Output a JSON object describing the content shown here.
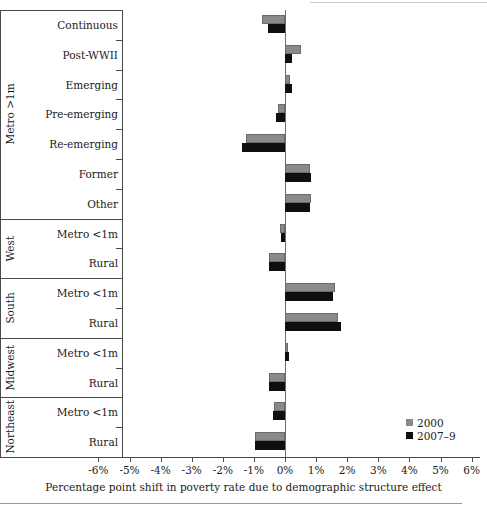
{
  "chart_data": {
    "type": "bar",
    "orientation": "horizontal",
    "title": "",
    "xlabel": "Percentage point shift in poverty rate due to demographic structure effect",
    "ylabel": "",
    "xlim": [
      -6,
      6
    ],
    "xticks": [
      "-6%",
      "-5%",
      "-4%",
      "-3%",
      "-2%",
      "-1%",
      "0%",
      "1%",
      "2%",
      "3%",
      "4%",
      "5%",
      "6%"
    ],
    "xtick_values": [
      -6,
      -5,
      -4,
      -3,
      -2,
      -1,
      0,
      1,
      2,
      3,
      4,
      5,
      6
    ],
    "grid": false,
    "legend_position": "bottom-right",
    "categories": [
      "Continuous",
      "Post-WWII",
      "Emerging",
      "Pre-emerging",
      "Re-emerging",
      "Former",
      "Other",
      "Metro <1m",
      "Rural",
      "Metro <1m",
      "Rural",
      "Metro <1m",
      "Rural",
      "Metro <1m",
      "Rural"
    ],
    "groups": [
      {
        "label": "Metro >1m",
        "start": 0,
        "count": 7
      },
      {
        "label": "West",
        "start": 7,
        "count": 2
      },
      {
        "label": "South",
        "start": 9,
        "count": 2
      },
      {
        "label": "Midwest",
        "start": 11,
        "count": 2
      },
      {
        "label": "Northeast",
        "start": 13,
        "count": 2
      }
    ],
    "series": [
      {
        "name": "2000",
        "color": "#8a8a8a",
        "values": [
          -0.75,
          0.5,
          0.15,
          -0.22,
          -1.25,
          0.8,
          0.82,
          -0.16,
          -0.52,
          1.62,
          1.72,
          0.1,
          -0.5,
          -0.36,
          -0.95
        ]
      },
      {
        "name": "2007–9",
        "color": "#0f0f0f",
        "values": [
          -0.56,
          0.22,
          0.22,
          -0.28,
          -1.38,
          0.82,
          0.8,
          -0.14,
          -0.5,
          1.55,
          1.8,
          0.12,
          -0.52,
          -0.4,
          -0.98
        ]
      }
    ]
  },
  "legend": {
    "items": [
      {
        "label": "2000",
        "color": "#8a8a8a"
      },
      {
        "label": "2007–9",
        "color": "#0f0f0f"
      }
    ]
  },
  "axis": {
    "title": "Percentage point shift in poverty rate due to demographic structure effect"
  }
}
